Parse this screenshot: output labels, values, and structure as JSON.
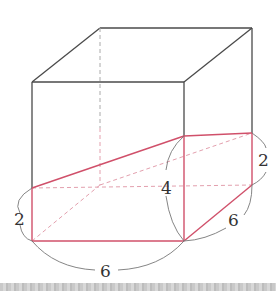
{
  "figure": {
    "colors": {
      "box_edge": "#4a4a4a",
      "hidden_edge": "#aaaaaa",
      "cut_edge": "#d0506a",
      "cut_hidden": "#e3a0ae",
      "dimension_arc": "#777777",
      "label": "#333333"
    },
    "labels": {
      "left_height": "2",
      "front_length": "6",
      "middle_height": "4",
      "right_depth": "6",
      "right_height": "2"
    }
  }
}
